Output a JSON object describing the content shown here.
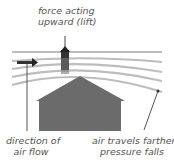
{
  "labels": {
    "lift_line1": "force acting",
    "lift_line2": "upward (lift)",
    "flow_line1": "direction of",
    "flow_line2": "air flow",
    "pressure_line1": "air travels farther;",
    "pressure_line2": "pressure falls"
  },
  "colors": {
    "house": "#6b6b6b",
    "streamline": "#bdbdbd",
    "arrow": "#222222",
    "text": "#555555"
  }
}
